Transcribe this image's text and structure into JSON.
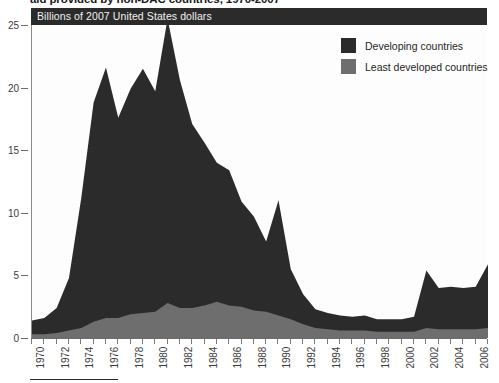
{
  "figure": {
    "title_clipped": "aid provided by non-DAC countries, 1970-2007",
    "banner_label": "Billions of 2007 United States dollars",
    "colors": {
      "developing": "#2b2b2b",
      "least_developed": "#6e6e6e",
      "banner_bg": "#2b2b2b",
      "banner_text": "#f2f2f2",
      "axis": "#6b6b6b",
      "plot_bg": "#fdfdfd"
    }
  },
  "legend": {
    "position": "top-right",
    "items": [
      {
        "label": "Developing countries",
        "color": "#2b2b2b",
        "swatch": "square-swatch"
      },
      {
        "label": "Least developed countries",
        "color": "#6e6e6e",
        "swatch": "square-swatch"
      }
    ]
  },
  "y_axis": {
    "ticks": [
      0,
      5,
      10,
      15,
      20,
      25
    ],
    "labels": [
      "0",
      "5",
      "10",
      "15",
      "20",
      "25"
    ],
    "min": 0,
    "max": 25
  },
  "x_axis": {
    "min": 1970,
    "max": 2007,
    "tick_step": 1,
    "label_step": 2,
    "labels": [
      "1970",
      "1972",
      "1974",
      "1976",
      "1978",
      "1980",
      "1982",
      "1984",
      "1986",
      "1988",
      "1990",
      "1992",
      "1994",
      "1996",
      "1998",
      "2000",
      "2002",
      "2004",
      "2006"
    ]
  },
  "chart_data": {
    "type": "area",
    "stacked": true,
    "title": "aid provided by non-DAC countries, 1970-2007",
    "xlabel": "",
    "ylabel": "Billions of 2007 United States dollars",
    "xlim": [
      1970,
      2007
    ],
    "ylim": [
      0,
      25
    ],
    "grid": false,
    "legend_position": "top-right",
    "x": [
      1970,
      1971,
      1972,
      1973,
      1974,
      1975,
      1976,
      1977,
      1978,
      1979,
      1980,
      1981,
      1982,
      1983,
      1984,
      1985,
      1986,
      1987,
      1988,
      1989,
      1990,
      1991,
      1992,
      1993,
      1994,
      1995,
      1996,
      1997,
      1998,
      1999,
      2000,
      2001,
      2002,
      2003,
      2004,
      2005,
      2006,
      2007
    ],
    "series": [
      {
        "name": "Developing countries",
        "color": "#2b2b2b",
        "values": [
          1.1,
          1.3,
          2.0,
          4.2,
          10.4,
          17.5,
          20.0,
          16.0,
          18.0,
          19.5,
          17.6,
          22.7,
          18.2,
          14.7,
          13.0,
          11.1,
          10.8,
          8.4,
          7.5,
          5.6,
          9.2,
          4.0,
          2.4,
          1.5,
          1.3,
          1.2,
          1.1,
          1.2,
          1.0,
          1.0,
          1.0,
          1.2,
          4.6,
          3.3,
          3.4,
          3.3,
          3.4,
          5.1
        ]
      },
      {
        "name": "Least developed countries",
        "color": "#6e6e6e",
        "values": [
          0.3,
          0.3,
          0.4,
          0.6,
          0.8,
          1.3,
          1.6,
          1.6,
          1.9,
          2.0,
          2.1,
          2.8,
          2.4,
          2.4,
          2.6,
          2.9,
          2.6,
          2.5,
          2.2,
          2.1,
          1.8,
          1.5,
          1.1,
          0.8,
          0.7,
          0.6,
          0.6,
          0.6,
          0.5,
          0.5,
          0.5,
          0.5,
          0.8,
          0.7,
          0.7,
          0.7,
          0.7,
          0.8
        ]
      }
    ]
  }
}
